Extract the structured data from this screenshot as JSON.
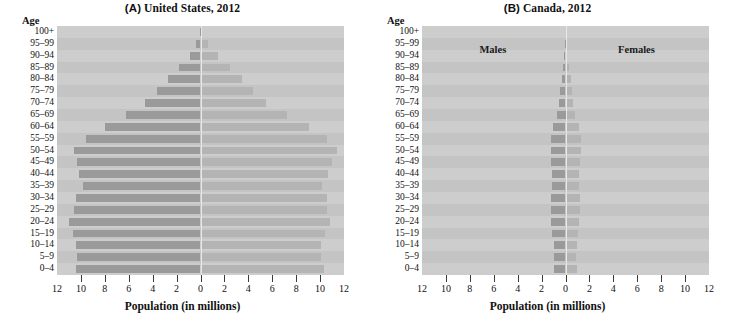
{
  "figure": {
    "width": 731,
    "height": 326,
    "background": "#ffffff"
  },
  "colors": {
    "plot_background": "#c9c9c9",
    "row_band_light": "#cdcdcd",
    "row_band_dark": "#c4c4c4",
    "male_bar": "#9a9a9a",
    "female_bar": "#b4b4b4",
    "center_line": "#e8e8e8",
    "tick": "#3a3a3a",
    "text": "#111111"
  },
  "axis_common": {
    "y_header": "Age",
    "x_title": "Population (in millions)",
    "x_tick_labels": [
      "12",
      "10",
      "8",
      "6",
      "4",
      "2",
      "0",
      "2",
      "4",
      "6",
      "8",
      "10",
      "12"
    ],
    "x_tick_values": [
      -12,
      -10,
      -8,
      -6,
      -4,
      -2,
      0,
      2,
      4,
      6,
      8,
      10,
      12
    ],
    "xlim": [
      -12,
      12
    ],
    "age_groups": [
      "100+",
      "95–99",
      "90–94",
      "85–89",
      "80–84",
      "75–79",
      "70–74",
      "65–69",
      "60–64",
      "55–59",
      "50–54",
      "45–49",
      "40–44",
      "35–39",
      "30–34",
      "25–29",
      "20–24",
      "15–19",
      "10–14",
      "5–9",
      "0–4"
    ]
  },
  "panels": [
    {
      "id": "panel-a",
      "tag": "(A)",
      "title_text": "United States, 2012",
      "legend": []
    },
    {
      "id": "panel-b",
      "tag": "(B)",
      "title_text": "Canada, 2012",
      "legend": [
        {
          "name": "males-legend-label",
          "text": "Males",
          "side": "left"
        },
        {
          "name": "females-legend-label",
          "text": "Females",
          "side": "right"
        }
      ]
    }
  ],
  "chart_data": [
    {
      "type": "bar",
      "subtype": "population-pyramid",
      "panel": "A",
      "title": "(A) United States, 2012",
      "xlabel": "Population (in millions)",
      "ylabel": "Age",
      "xlim": [
        -12,
        12
      ],
      "grid": false,
      "legend_position": "none",
      "orientation": "horizontal-diverging",
      "categories": [
        "100+",
        "95–99",
        "90–94",
        "85–89",
        "80–84",
        "75–79",
        "70–74",
        "65–69",
        "60–64",
        "55–59",
        "50–54",
        "45–49",
        "40–44",
        "35–39",
        "30–34",
        "25–29",
        "20–24",
        "15–19",
        "10–14",
        "5–9",
        "0–4"
      ],
      "series": [
        {
          "name": "Males",
          "side": "left",
          "units": "millions",
          "values": [
            0.06,
            0.4,
            0.9,
            1.8,
            2.7,
            3.6,
            4.6,
            6.2,
            8.0,
            9.6,
            10.6,
            10.3,
            10.2,
            9.8,
            10.4,
            10.6,
            11.0,
            10.7,
            10.4,
            10.3,
            10.4
          ]
        },
        {
          "name": "Females",
          "side": "right",
          "units": "millions",
          "values": [
            0.14,
            0.6,
            1.5,
            2.5,
            3.5,
            4.4,
            5.5,
            7.2,
            9.1,
            10.6,
            11.4,
            11.0,
            10.7,
            10.2,
            10.6,
            10.6,
            10.8,
            10.4,
            10.1,
            10.1,
            10.3
          ]
        }
      ]
    },
    {
      "type": "bar",
      "subtype": "population-pyramid",
      "panel": "B",
      "title": "(B) Canada, 2012",
      "xlabel": "Population (in millions)",
      "ylabel": "Age",
      "xlim": [
        -12,
        12
      ],
      "grid": false,
      "legend_position": "inside-top",
      "orientation": "horizontal-diverging",
      "categories": [
        "100+",
        "95–99",
        "90–94",
        "85–89",
        "80–84",
        "75–79",
        "70–74",
        "65–69",
        "60–64",
        "55–59",
        "50–54",
        "45–49",
        "40–44",
        "35–39",
        "30–34",
        "25–29",
        "20–24",
        "15–19",
        "10–14",
        "5–9",
        "0–4"
      ],
      "series": [
        {
          "name": "Males",
          "side": "left",
          "units": "millions",
          "values": [
            0.005,
            0.03,
            0.09,
            0.2,
            0.32,
            0.45,
            0.58,
            0.75,
            1.05,
            1.25,
            1.25,
            1.18,
            1.13,
            1.15,
            1.18,
            1.18,
            1.2,
            1.1,
            1.0,
            0.95,
            0.97
          ]
        },
        {
          "name": "Females",
          "side": "right",
          "units": "millions",
          "values": [
            0.015,
            0.06,
            0.16,
            0.3,
            0.42,
            0.55,
            0.66,
            0.82,
            1.1,
            1.3,
            1.3,
            1.2,
            1.14,
            1.15,
            1.2,
            1.18,
            1.17,
            1.05,
            0.95,
            0.9,
            0.92
          ]
        }
      ]
    }
  ]
}
